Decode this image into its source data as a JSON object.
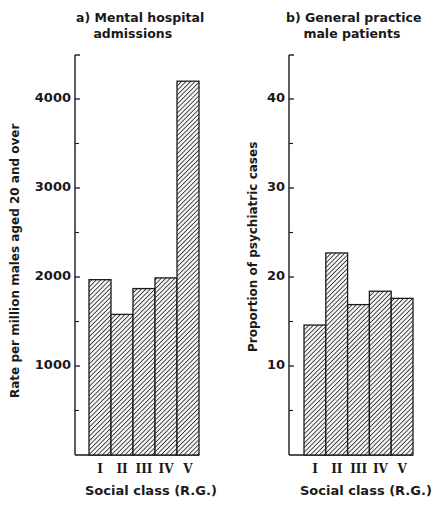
{
  "chart_data": [
    {
      "type": "bar",
      "title": "a) Mental hospital admissions",
      "title_lines": [
        "a) Mental hospital",
        "    admissions"
      ],
      "xlabel": "Social class (R.G.)",
      "ylabel": "Rate per million males aged 20 and over",
      "categories": [
        "I",
        "II",
        "III",
        "IV",
        "V"
      ],
      "values": [
        1970,
        1580,
        1870,
        1990,
        4200
      ],
      "yticks": [
        1000,
        2000,
        3000,
        4000
      ],
      "ytick_labels": [
        "1000",
        "2000",
        "3000",
        "4000"
      ],
      "minor_ticks": [
        500,
        1500,
        2500,
        3500
      ],
      "ylim": [
        0,
        4450
      ],
      "grid": false,
      "legend": "none",
      "fill": "diagonal-hatch"
    },
    {
      "type": "bar",
      "title": "b) General practice male patients",
      "title_lines": [
        "b) General practice",
        "    male patients"
      ],
      "xlabel": "Social class (R.G.)",
      "ylabel": "Proportion of psychiatric cases",
      "categories": [
        "I",
        "II",
        "III",
        "IV",
        "V"
      ],
      "values": [
        14.6,
        22.7,
        16.9,
        18.4,
        17.6
      ],
      "yticks": [
        10,
        20,
        30,
        40
      ],
      "ytick_labels": [
        "10",
        "20",
        "30",
        "40"
      ],
      "minor_ticks": [
        5,
        15,
        25,
        35
      ],
      "ylim": [
        0,
        44.5
      ],
      "grid": false,
      "legend": "none",
      "fill": "diagonal-hatch"
    }
  ],
  "colors": {
    "ink": "#1a1a1a",
    "background": "#ffffff"
  }
}
